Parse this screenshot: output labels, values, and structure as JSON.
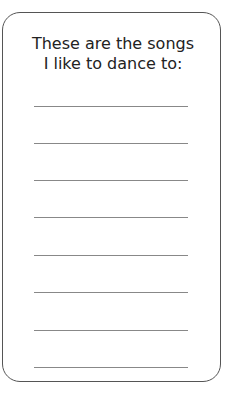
{
  "card": {
    "title_line1": "These are the songs",
    "title_line2": "I like to dance to:",
    "blank_lines": 8
  }
}
